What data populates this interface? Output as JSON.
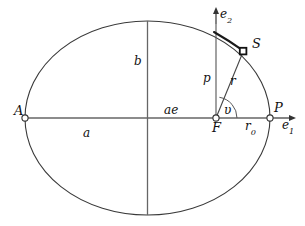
{
  "figure": {
    "type": "geometric-diagram",
    "colors": {
      "stroke": "#3a3a3a",
      "axis": "#555555",
      "text": "#111111",
      "marker_fill": "#ffffff",
      "background": "#ffffff"
    },
    "geometry": {
      "center": {
        "x": 147.5,
        "y": 118
      },
      "semi_major_a_px": 122.5,
      "semi_minor_b_px": 97,
      "focus_F": {
        "x": 216,
        "y": 118
      },
      "apoapsis_A": {
        "x": 25,
        "y": 118
      },
      "periapsis_P": {
        "x": 270,
        "y": 118
      },
      "satellite_S": {
        "x": 243,
        "y": 51
      },
      "semi_latus_rectum_top": {
        "x": 216,
        "y": 33
      },
      "e1_arrow_end": {
        "x": 296,
        "y": 118
      },
      "e2_arrow_end": {
        "x": 216,
        "y": 9
      },
      "nu_arc_radius_px": 21
    }
  },
  "labels": {
    "apoapsis": "A",
    "periapsis": "P",
    "satellite": "S",
    "focus": "F",
    "semi_major": "a",
    "semi_minor": "b",
    "focal_distance": "ae",
    "semi_latus_rectum": "p",
    "radius": "r",
    "periapsis_radius_base": "r",
    "periapsis_radius_sub": "0",
    "true_anomaly": "υ",
    "basis_e1_base": "e",
    "basis_e1_sub": "1",
    "basis_e2_base": "e",
    "basis_e2_sub": "2"
  }
}
